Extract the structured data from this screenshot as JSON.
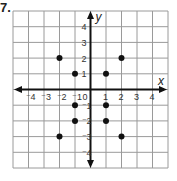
{
  "problem": {
    "number": "7."
  },
  "chart_data": {
    "type": "scatter",
    "title": "",
    "xlabel": "x",
    "ylabel": "y",
    "xlim": [
      -5,
      5
    ],
    "ylim": [
      -5,
      5
    ],
    "grid": true,
    "x_ticks": [
      "-4",
      "-3",
      "-2",
      "-1",
      "0",
      "1",
      "2",
      "3",
      "4"
    ],
    "y_ticks": [
      "4",
      "3",
      "2",
      "1",
      "-1",
      "-2",
      "-3",
      "-4"
    ],
    "origin_label": "0",
    "points": [
      {
        "x": -2,
        "y": 2
      },
      {
        "x": -1,
        "y": 1
      },
      {
        "x": 1,
        "y": 1
      },
      {
        "x": 2,
        "y": 2
      },
      {
        "x": -1,
        "y": -1
      },
      {
        "x": 1,
        "y": -1
      },
      {
        "x": -1,
        "y": -2
      },
      {
        "x": 1,
        "y": -2
      },
      {
        "x": -2,
        "y": -3
      },
      {
        "x": 2,
        "y": -3
      }
    ],
    "colors": {
      "grid": "#9a9a9a",
      "axis": "#111111",
      "point": "#111111"
    }
  }
}
